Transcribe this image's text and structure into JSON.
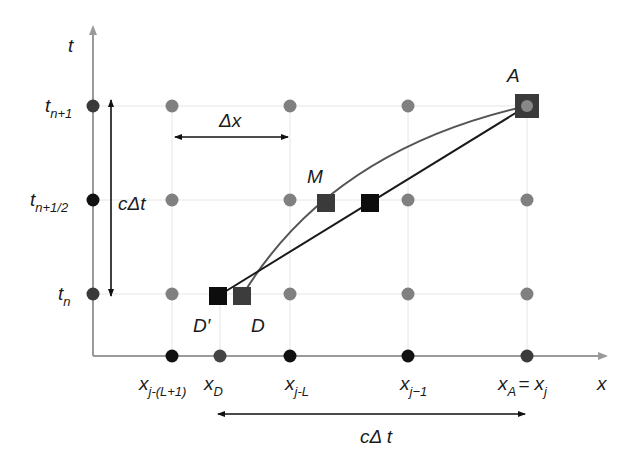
{
  "diagram": {
    "colors": {
      "axis": "#9a9a9a",
      "grid_line": "#e4e4e4",
      "grid_dot": "#7f7f7f",
      "axis_dot_black": "#111111",
      "axis_dot_dark": "#3a3a3a",
      "curve": "#555555",
      "straight": "#1a1a1a",
      "square_black": "#0d0d0d",
      "square_dark": "#3c3c3c"
    },
    "axes": {
      "t_label": "t",
      "x_label": "x"
    },
    "t_ticks": [
      {
        "base": "t",
        "sub": "n+1"
      },
      {
        "base": "t",
        "sub": "n+1/2"
      },
      {
        "base": "t",
        "sub": "n"
      }
    ],
    "x_ticks": [
      {
        "base": "x",
        "sub": "j-(L+1)"
      },
      {
        "base": "x",
        "sub": "D"
      },
      {
        "base": "x",
        "sub": "j-L"
      },
      {
        "base": "x",
        "sub": "j−1"
      },
      {
        "base": "x",
        "sub": "A",
        "eq_base": "= x",
        "eq_sub": "j"
      }
    ],
    "points": {
      "A": "A",
      "M": "M",
      "D": "D",
      "D_prime": "D′"
    },
    "dimensions": {
      "dx_label": "Δx",
      "cdt_vertical_label": "cΔt",
      "cdt_horizontal_label": "cΔ t"
    }
  }
}
